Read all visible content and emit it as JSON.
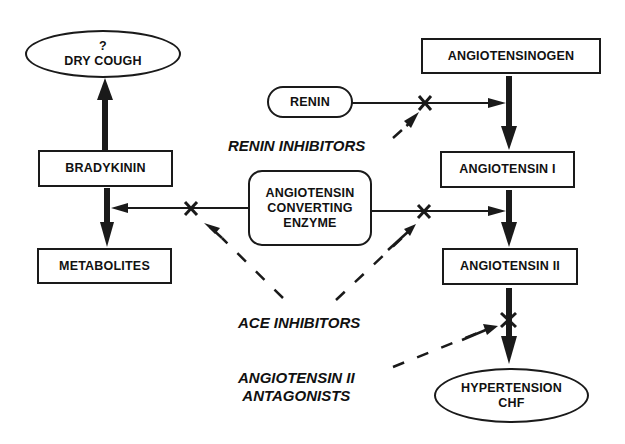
{
  "diagram": {
    "nodes": {
      "dry_cough": {
        "line1": "?",
        "line2": "DRY COUGH",
        "shape": "ellipse"
      },
      "bradykinin": {
        "label": "BRADYKININ",
        "shape": "rect"
      },
      "metabolites": {
        "label": "METABOLITES",
        "shape": "rect"
      },
      "renin": {
        "label": "RENIN",
        "shape": "pill"
      },
      "ace": {
        "line1": "ANGIOTENSIN",
        "line2": "CONVERTING",
        "line3": "ENZYME",
        "shape": "rounded-rect"
      },
      "angiotensinogen": {
        "label": "ANGIOTENSINOGEN",
        "shape": "rect"
      },
      "angiotensin_1": {
        "label": "ANGIOTENSIN I",
        "shape": "rect"
      },
      "angiotensin_2": {
        "label": "ANGIOTENSIN II",
        "shape": "rect"
      },
      "hypertension": {
        "line1": "HYPERTENSION",
        "line2": "CHF",
        "shape": "ellipse"
      }
    },
    "inhibitor_labels": {
      "renin_inhibitors": "RENIN INHIBITORS",
      "ace_inhibitors": "ACE INHIBITORS",
      "at2_antagonists_line1": "ANGIOTENSIN II",
      "at2_antagonists_line2": "ANTAGONISTS"
    },
    "block_marker": "X",
    "edges": [
      {
        "from": "bradykinin",
        "to": "dry_cough",
        "style": "thick"
      },
      {
        "from": "bradykinin",
        "to": "metabolites",
        "style": "thick"
      },
      {
        "from": "ace",
        "to": "bradykinin-metabolites",
        "style": "thin",
        "blocked": true
      },
      {
        "from": "ace",
        "to": "angiotensin_1-angiotensin_2",
        "style": "thin",
        "blocked": true
      },
      {
        "from": "renin",
        "to": "angiotensinogen-angiotensin_1",
        "style": "thin",
        "blocked": true
      },
      {
        "from": "angiotensinogen",
        "to": "angiotensin_1",
        "style": "thick"
      },
      {
        "from": "angiotensin_1",
        "to": "angiotensin_2",
        "style": "thick"
      },
      {
        "from": "angiotensin_2",
        "to": "hypertension",
        "style": "thick",
        "blocked": true
      },
      {
        "from": "renin_inhibitors",
        "to": "renin-block",
        "style": "arrow"
      },
      {
        "from": "ace_inhibitors",
        "to": "ace-left-block",
        "style": "dashed"
      },
      {
        "from": "ace_inhibitors",
        "to": "ace-right-block",
        "style": "dashed"
      },
      {
        "from": "at2_antagonists",
        "to": "angiotensin_2-block",
        "style": "dashed"
      }
    ],
    "colors": {
      "ink": "#1a1a1a",
      "background": "#ffffff"
    }
  }
}
